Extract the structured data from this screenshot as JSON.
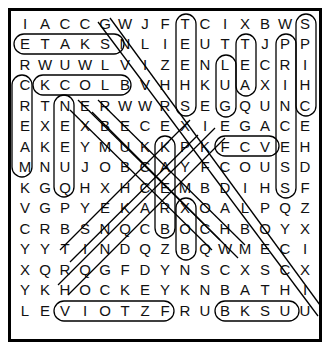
{
  "puzzle": {
    "rows": [
      "IACCGWJFTCIXBWS",
      "ETAKSNLIEUTTJPP",
      "RWUWLVIZENLECRI",
      "CKCOLBVHHKUAXIH",
      "RTNERWWRSEGQUNC",
      "EXEXBECEXIEGACE",
      "AKEYMUKKPKFCVEH",
      "MNUJOBCAYFCOUSD",
      "KGQHXHCEMBDIHSF",
      "VGPYEKARXOALPQZ",
      "CRBSNQCBOCHBOYX",
      "YYTINDQZBQWMECI",
      "XQRQGFDYNSCXSCX",
      "YKHOCKEYKNBATHI",
      "LEVIOTZFRUBKSUU"
    ],
    "found_words": [
      {
        "word": "SKATE",
        "start": [
          1,
          4
        ],
        "end": [
          1,
          0
        ]
      },
      {
        "word": "BLOCK",
        "start": [
          3,
          5
        ],
        "end": [
          3,
          1
        ]
      },
      {
        "word": "HOCKEY",
        "start": [
          13,
          2
        ],
        "end": [
          13,
          7
        ]
      },
      {
        "word": "BATH",
        "start": [
          13,
          10
        ],
        "end": [
          13,
          13
        ]
      },
      {
        "word": "EGA",
        "start": [
          5,
          10
        ],
        "end": [
          5,
          12
        ]
      },
      {
        "word": "TEEHS",
        "start": [
          0,
          8
        ],
        "end": [
          4,
          8
        ]
      },
      {
        "word": "LUG",
        "start": [
          2,
          10
        ],
        "end": [
          4,
          10
        ]
      },
      {
        "word": "TEA",
        "start": [
          1,
          11
        ],
        "end": [
          3,
          11
        ]
      },
      {
        "word": "PRINCESS",
        "start": [
          1,
          13
        ],
        "end": [
          8,
          13
        ]
      },
      {
        "word": "SPICH",
        "start": [
          0,
          14
        ],
        "end": [
          4,
          14
        ]
      },
      {
        "word": "CREAM",
        "start": [
          3,
          0
        ],
        "end": [
          7,
          0
        ]
      },
      {
        "word": "NEEUQ",
        "start": [
          4,
          2
        ],
        "end": [
          8,
          2
        ]
      },
      {
        "word": "XOB",
        "start": [
          9,
          8
        ],
        "end": [
          11,
          8
        ]
      },
      {
        "word": "KAB",
        "start": [
          6,
          7
        ],
        "end": [
          10,
          7
        ]
      }
    ]
  }
}
